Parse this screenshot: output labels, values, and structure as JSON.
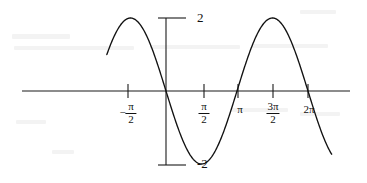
{
  "figure": {
    "title": "",
    "background_color": "#ffffff",
    "ink_color": "#111111"
  },
  "chart_data": {
    "type": "line",
    "title": "",
    "xlabel": "",
    "ylabel": "",
    "function": "y = -2 sin(x)",
    "amplitude": 2,
    "period": "2π",
    "grid": false,
    "legend": null,
    "xlim": [
      -2.6179938779914944,
      7.330382858376184
    ],
    "ylim": [
      -2.35,
      2.35
    ],
    "x_ticks": [
      {
        "value": -1.5707963267948966,
        "label_parts": {
          "sign": "−",
          "numerator": "π",
          "denominator": "2"
        },
        "label": "-π/2"
      },
      {
        "value": 1.5707963267948966,
        "label_parts": {
          "sign": "",
          "numerator": "π",
          "denominator": "2"
        },
        "label": "π/2"
      },
      {
        "value": 3.141592653589793,
        "label_parts": {
          "sign": "",
          "numerator": "",
          "denominator": ""
        },
        "label": "π"
      },
      {
        "value": 4.71238898038469,
        "label_parts": {
          "sign": "",
          "numerator": "3π",
          "denominator": "2"
        },
        "label": "3π/2"
      },
      {
        "value": 6.283185307179586,
        "label_parts": {
          "sign": "",
          "numerator": "",
          "denominator": ""
        },
        "label": "2π"
      }
    ],
    "y_ticks": [
      {
        "value": 2,
        "label": "2"
      },
      {
        "value": -2,
        "label": "-2"
      }
    ],
    "key_points": [
      {
        "x": "-π/2",
        "y": 2,
        "kind": "maximum"
      },
      {
        "x": "0",
        "y": 0,
        "kind": "zero-descending"
      },
      {
        "x": "π/2",
        "y": -2,
        "kind": "minimum"
      },
      {
        "x": "π",
        "y": 0,
        "kind": "zero-ascending"
      },
      {
        "x": "3π/2",
        "y": 2,
        "kind": "maximum"
      },
      {
        "x": "2π",
        "y": 0,
        "kind": "zero-descending"
      }
    ],
    "series": [
      {
        "name": "y = -2 sin(x)",
        "color": "#111111",
        "x": [
          -2.6179938779914944,
          -2.5,
          -2.4,
          -2.3,
          -2.2,
          -2.1,
          -2.0,
          -1.9,
          -1.8,
          -1.7,
          -1.5707963267948966,
          -1.45,
          -1.35,
          -1.25,
          -1.15,
          -1.05,
          -0.95,
          -0.85,
          -0.75,
          -0.65,
          -0.55,
          -0.45,
          -0.35,
          -0.25,
          -0.15,
          -0.05,
          0,
          0.1,
          0.2,
          0.3,
          0.4,
          0.5,
          0.6,
          0.7,
          0.8,
          0.9,
          1.0,
          1.1,
          1.2,
          1.3,
          1.4,
          1.5707963267948966,
          1.7,
          1.8,
          1.9,
          2.0,
          2.1,
          2.2,
          2.3,
          2.4,
          2.5,
          2.6,
          2.7,
          2.8,
          2.9,
          3.0,
          3.141592653589793,
          3.3,
          3.4,
          3.5,
          3.6,
          3.7,
          3.8,
          3.9,
          4.0,
          4.1,
          4.2,
          4.3,
          4.4,
          4.5,
          4.6,
          4.71238898038469,
          4.85,
          4.95,
          5.05,
          5.15,
          5.25,
          5.35,
          5.45,
          5.55,
          5.65,
          5.75,
          5.85,
          5.95,
          6.05,
          6.15,
          6.283185307179586,
          6.4,
          6.5,
          6.6,
          6.7,
          6.8,
          6.9,
          7.0,
          7.1,
          7.2,
          7.330382858376184
        ],
        "y_formula": "-2*sin(x)"
      }
    ]
  },
  "labels": {
    "y_top": "2",
    "y_bottom": "-2",
    "x_neg_half_pi_sign": "−",
    "x_neg_half_pi_num": "π",
    "x_neg_half_pi_den": "2",
    "x_half_pi_num": "π",
    "x_half_pi_den": "2",
    "x_pi": "π",
    "x_three_half_pi_num": "3π",
    "x_three_half_pi_den": "2",
    "x_two_pi": "2π"
  }
}
